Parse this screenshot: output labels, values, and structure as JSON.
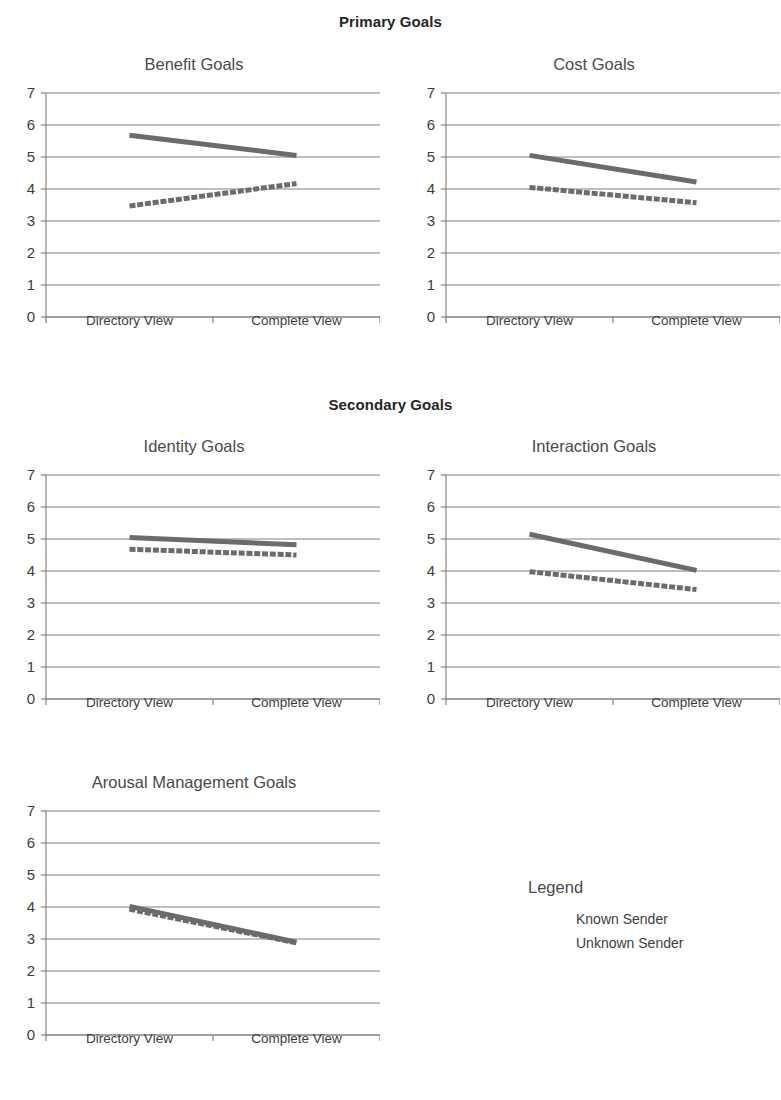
{
  "headers": {
    "primary": "Primary Goals",
    "secondary": "Secondary Goals"
  },
  "legend": {
    "title": "Legend",
    "entries": [
      {
        "label": "Known Sender",
        "style": "solid"
      },
      {
        "label": "Unknown Sender",
        "style": "dashed"
      }
    ]
  },
  "axis": {
    "categories": [
      "Directory View",
      "Complete View"
    ],
    "yticks": [
      "0",
      "1",
      "2",
      "3",
      "4",
      "5",
      "6",
      "7"
    ]
  },
  "colors": {
    "line": "#6b6b6b",
    "gridline": "#808080",
    "axis": "#808080",
    "text": "#3d3d3d",
    "header": "#262626"
  },
  "chart_data": [
    {
      "type": "line",
      "title": "Benefit Goals",
      "group": "Primary Goals",
      "xlabel": "",
      "ylabel": "",
      "categories": [
        "Directory View",
        "Complete View"
      ],
      "ylim": [
        0,
        7
      ],
      "yticks": [
        0,
        1,
        2,
        3,
        4,
        5,
        6,
        7
      ],
      "grid": true,
      "legend_position": "external-right",
      "series": [
        {
          "name": "Known Sender",
          "values": [
            5.68,
            5.05
          ]
        },
        {
          "name": "Unknown Sender",
          "values": [
            3.47,
            4.17
          ]
        }
      ]
    },
    {
      "type": "line",
      "title": "Cost Goals",
      "group": "Primary Goals",
      "xlabel": "",
      "ylabel": "",
      "categories": [
        "Directory View",
        "Complete View"
      ],
      "ylim": [
        0,
        7
      ],
      "yticks": [
        0,
        1,
        2,
        3,
        4,
        5,
        6,
        7
      ],
      "grid": true,
      "legend_position": "external-right",
      "series": [
        {
          "name": "Known Sender",
          "values": [
            5.05,
            4.22
          ]
        },
        {
          "name": "Unknown Sender",
          "values": [
            4.05,
            3.57
          ]
        }
      ]
    },
    {
      "type": "line",
      "title": "Identity Goals",
      "group": "Secondary Goals",
      "xlabel": "",
      "ylabel": "",
      "categories": [
        "Directory View",
        "Complete View"
      ],
      "ylim": [
        0,
        7
      ],
      "yticks": [
        0,
        1,
        2,
        3,
        4,
        5,
        6,
        7
      ],
      "grid": true,
      "legend_position": "external-right",
      "series": [
        {
          "name": "Known Sender",
          "values": [
            5.05,
            4.82
          ]
        },
        {
          "name": "Unknown Sender",
          "values": [
            4.68,
            4.5
          ]
        }
      ]
    },
    {
      "type": "line",
      "title": "Interaction Goals",
      "group": "Secondary Goals",
      "xlabel": "",
      "ylabel": "",
      "categories": [
        "Directory View",
        "Complete View"
      ],
      "ylim": [
        0,
        7
      ],
      "yticks": [
        0,
        1,
        2,
        3,
        4,
        5,
        6,
        7
      ],
      "grid": true,
      "legend_position": "external-right",
      "series": [
        {
          "name": "Known Sender",
          "values": [
            5.15,
            4.02
          ]
        },
        {
          "name": "Unknown Sender",
          "values": [
            3.98,
            3.42
          ]
        }
      ]
    },
    {
      "type": "line",
      "title": "Arousal Management Goals",
      "group": "Secondary Goals",
      "xlabel": "",
      "ylabel": "",
      "categories": [
        "Directory View",
        "Complete View"
      ],
      "ylim": [
        0,
        7
      ],
      "yticks": [
        0,
        1,
        2,
        3,
        4,
        5,
        6,
        7
      ],
      "grid": true,
      "legend_position": "external-right",
      "series": [
        {
          "name": "Known Sender",
          "values": [
            4.02,
            2.9
          ]
        },
        {
          "name": "Unknown Sender",
          "values": [
            3.93,
            2.88
          ]
        }
      ]
    }
  ]
}
